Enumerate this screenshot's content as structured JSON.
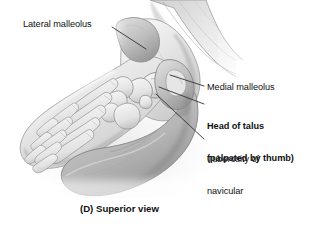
{
  "figure": {
    "caption": "(D) Superior view",
    "view_type": "superior-view",
    "background_color": "#ffffff",
    "text_color": "#111111",
    "leader_line_color": "#333333"
  },
  "labels": {
    "lateral_malleolus": {
      "text": "Lateral malleolus",
      "bold": false,
      "leader": {
        "x1": 112,
        "y1": 27,
        "x2": 146,
        "y2": 49
      }
    },
    "medial_malleolus": {
      "text": "Medial malleolus",
      "bold": false,
      "leader": {
        "x1": 204,
        "y1": 86,
        "x2": 170,
        "y2": 75
      }
    },
    "head_of_talus_line1": {
      "text": "Head of talus",
      "bold": true
    },
    "head_of_talus_line2": {
      "text": "(palpated by thumb)",
      "bold": true,
      "leader": {
        "x1": 204,
        "y1": 104,
        "x2": 159,
        "y2": 87
      }
    },
    "tuberosity_line1": {
      "text": "Tuberosity of",
      "bold": false
    },
    "tuberosity_line2": {
      "text": "navicular",
      "bold": false,
      "leader": {
        "x1": 204,
        "y1": 139,
        "x2": 156,
        "y2": 94
      }
    }
  },
  "illustration": {
    "name": "grayscale-anatomical-drawing-foot-ankle",
    "description": "Grayscale medical illustration of a right foot viewed from above, held by an examiner's hand, with the thumb palpating the head of the talus. Skeletal bones of the foot are visible through translucent skin.",
    "palette": {
      "skin_light": "#f2f2f2",
      "skin_mid": "#d8d8d8",
      "skin_shadow": "#a8a8a8",
      "skin_deep_shadow": "#7e7e7e",
      "bone_light": "#ececec",
      "bone_outline": "#8a8a8a",
      "outline": "#6b6b6b"
    }
  }
}
